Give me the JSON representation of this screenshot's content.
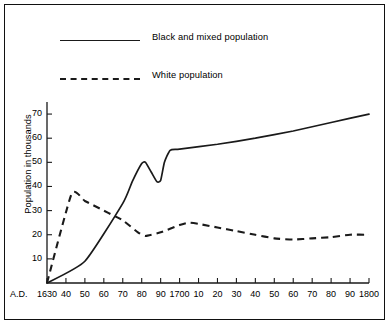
{
  "figure": {
    "border_color": "#111111",
    "background": "#ffffff",
    "line_color": "#1a1a1a"
  },
  "legend": {
    "position": "top-left-inside",
    "entries": [
      {
        "label": "Black and mixed population",
        "style": "solid",
        "sample_name": "legend-sample-solid"
      },
      {
        "label": "White population",
        "style": "dashed",
        "sample_name": "legend-sample-dashed"
      }
    ]
  },
  "axes": {
    "ylabel": "Population in thousands",
    "xlabel": "",
    "era_prefix": "A.D.",
    "yticks": [
      10,
      20,
      30,
      40,
      50,
      60,
      70
    ],
    "ytick_labels": [
      "10",
      "20",
      "30",
      "40",
      "50",
      "60",
      "70"
    ],
    "ylim": [
      0,
      75
    ],
    "xlim": [
      1630,
      1800
    ],
    "xticks": [
      1630,
      1640,
      1650,
      1660,
      1670,
      1680,
      1690,
      1700,
      1710,
      1720,
      1730,
      1740,
      1750,
      1760,
      1770,
      1780,
      1790,
      1800
    ],
    "xtick_labels": [
      "1630",
      "40",
      "50",
      "60",
      "70",
      "80",
      "90",
      "1700",
      "10",
      "20",
      "30",
      "40",
      "50",
      "60",
      "70",
      "80",
      "90",
      "1800"
    ],
    "grid": false
  },
  "chart_data": {
    "type": "line",
    "title": "",
    "xlabel": "",
    "ylabel": "Population in thousands",
    "xlim": [
      1630,
      1800
    ],
    "ylim": [
      0,
      75
    ],
    "grid": false,
    "legend_position": "upper left",
    "series": [
      {
        "name": "Black and mixed population",
        "style": "solid",
        "x": [
          1630,
          1650,
          1670,
          1675,
          1680,
          1682,
          1685,
          1688,
          1690,
          1692,
          1695,
          1700,
          1720,
          1740,
          1760,
          1780,
          1800
        ],
        "values": [
          0,
          9,
          33,
          42,
          49.5,
          50,
          46,
          42,
          42.5,
          50,
          55,
          55.5,
          57.5,
          60,
          63,
          66.5,
          70
        ]
      },
      {
        "name": "White population",
        "style": "dashed",
        "x": [
          1630,
          1643,
          1650,
          1660,
          1665,
          1670,
          1678,
          1682,
          1690,
          1700,
          1705,
          1710,
          1720,
          1730,
          1740,
          1750,
          1760,
          1770,
          1780,
          1790,
          1800
        ],
        "values": [
          0,
          37,
          34,
          30,
          28,
          26,
          21,
          19.5,
          21,
          24,
          25,
          24.5,
          23,
          21.5,
          20,
          18.5,
          18,
          18.5,
          19,
          20,
          20
        ]
      }
    ]
  }
}
